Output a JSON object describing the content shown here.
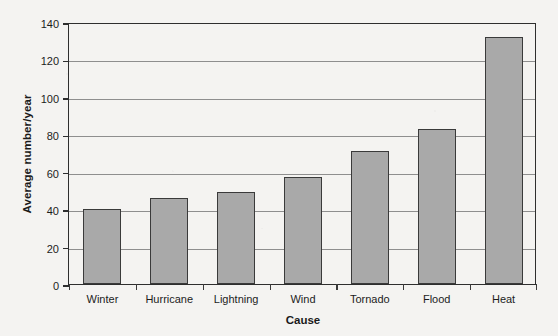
{
  "chart_data": {
    "type": "bar",
    "title": "",
    "xlabel": "Cause",
    "ylabel": "Average number/year",
    "categories": [
      "Winter",
      "Hurricane",
      "Lightning",
      "Wind",
      "Tornado",
      "Flood",
      "Heat"
    ],
    "values": [
      40,
      46,
      49,
      57,
      71,
      83,
      132
    ],
    "ylim": [
      0,
      140
    ],
    "yticks": [
      0,
      20,
      40,
      60,
      80,
      100,
      120,
      140
    ],
    "ytick_labels": [
      "0",
      "20",
      "40",
      "60",
      "80",
      "100",
      "120",
      "140"
    ],
    "grid": "horizontal",
    "legend": "none",
    "bar_color": "#a9a9a9",
    "bar_edge_color": "#3a3a3a",
    "axis_color": "#2e2e2e",
    "grid_color": "#8e8e8e",
    "background_color": "#f4f3f1"
  }
}
